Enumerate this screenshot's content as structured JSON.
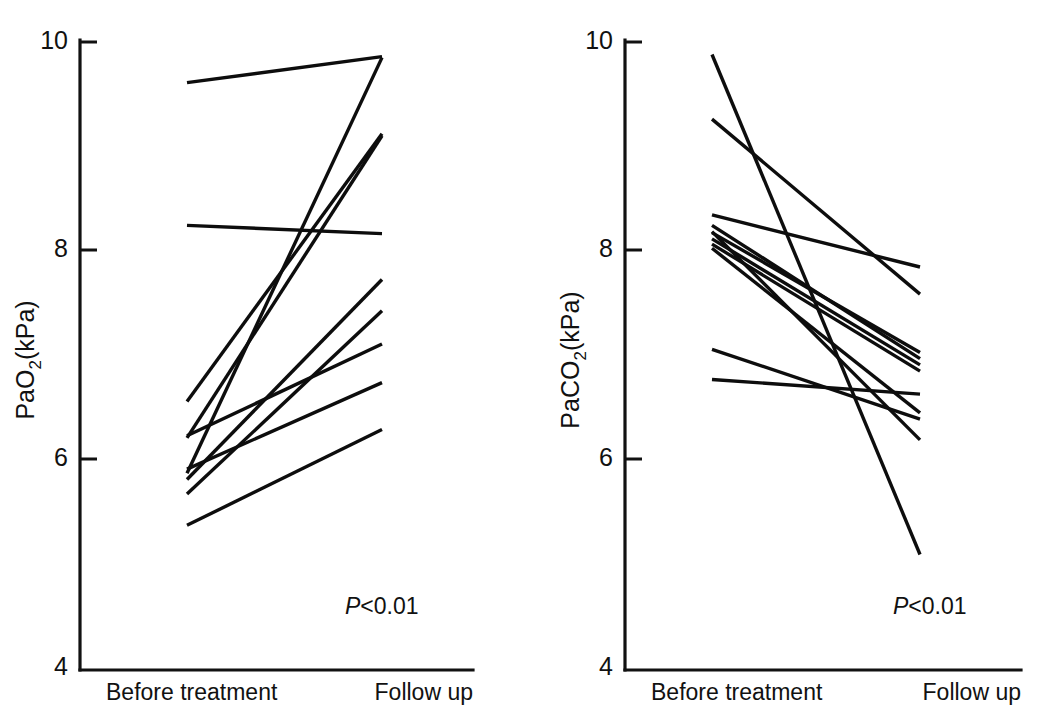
{
  "figure": {
    "background": "#ffffff",
    "ink_color": "#111111",
    "width": 1041,
    "height": 722
  },
  "chart_data": [
    {
      "type": "line",
      "panel": "left",
      "title": "",
      "xlabel": "",
      "ylabel": "PaO2(kPa)",
      "ylabel_base": "PaO",
      "ylabel_sub": "2",
      "ylabel_unit": "(kPa)",
      "categories": [
        "Before treatment",
        "Follow up"
      ],
      "ytick_labels": [
        "10",
        "8",
        "6",
        "4"
      ],
      "ytick_values": [
        10,
        8,
        6,
        4
      ],
      "ylim": [
        4,
        10
      ],
      "grid": false,
      "legend": "none",
      "annotation": "P<0.01",
      "annotation_prefix": "P",
      "annotation_rest": "<0.01",
      "series": [
        {
          "name": "subject-1",
          "values": [
            9.61,
            9.86
          ]
        },
        {
          "name": "subject-2",
          "values": [
            8.24,
            8.16
          ]
        },
        {
          "name": "subject-3",
          "values": [
            6.55,
            9.12
          ]
        },
        {
          "name": "subject-4",
          "values": [
            6.2,
            9.1
          ]
        },
        {
          "name": "subject-5",
          "values": [
            5.86,
            9.85
          ]
        },
        {
          "name": "subject-6",
          "values": [
            5.8,
            7.72
          ]
        },
        {
          "name": "subject-7",
          "values": [
            5.66,
            7.42
          ]
        },
        {
          "name": "subject-8",
          "values": [
            6.22,
            7.1
          ]
        },
        {
          "name": "subject-9",
          "values": [
            5.9,
            6.73
          ]
        },
        {
          "name": "subject-10",
          "values": [
            5.36,
            6.28
          ]
        }
      ]
    },
    {
      "type": "line",
      "panel": "right",
      "title": "",
      "xlabel": "",
      "ylabel": "PaCO2(kPa)",
      "ylabel_base": "PaCO",
      "ylabel_sub": "2",
      "ylabel_unit": "(kPa)",
      "categories": [
        "Before treatment",
        "Follow up"
      ],
      "ytick_labels": [
        "10",
        "8",
        "6",
        "4"
      ],
      "ytick_values": [
        10,
        8,
        6,
        4
      ],
      "ylim": [
        4,
        10
      ],
      "grid": false,
      "legend": "none",
      "annotation": "P<0.01",
      "annotation_prefix": "P",
      "annotation_rest": "<0.01",
      "series": [
        {
          "name": "subject-1",
          "values": [
            9.88,
            5.08
          ]
        },
        {
          "name": "subject-2",
          "values": [
            9.26,
            7.58
          ]
        },
        {
          "name": "subject-3",
          "values": [
            8.34,
            7.84
          ]
        },
        {
          "name": "subject-4",
          "values": [
            8.24,
            6.96
          ]
        },
        {
          "name": "subject-5",
          "values": [
            8.17,
            7.02
          ]
        },
        {
          "name": "subject-6",
          "values": [
            8.11,
            6.9
          ]
        },
        {
          "name": "subject-7",
          "values": [
            8.06,
            6.84
          ]
        },
        {
          "name": "subject-8",
          "values": [
            8.02,
            6.44
          ]
        },
        {
          "name": "subject-9",
          "values": [
            8.18,
            6.18
          ]
        },
        {
          "name": "subject-10",
          "values": [
            7.05,
            6.38
          ]
        },
        {
          "name": "subject-11",
          "values": [
            6.76,
            6.62
          ]
        }
      ]
    }
  ]
}
